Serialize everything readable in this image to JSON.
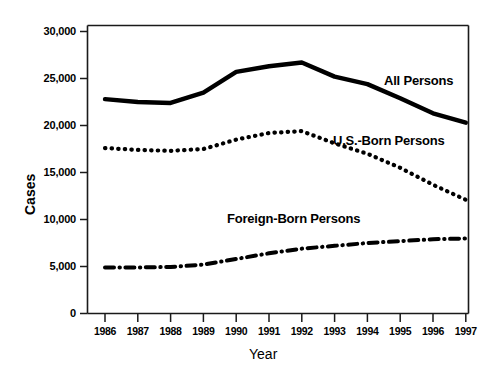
{
  "chart_data": {
    "type": "line",
    "title": "",
    "xlabel": "Year",
    "ylabel": "Cases",
    "x": [
      1986,
      1987,
      1988,
      1989,
      1990,
      1991,
      1992,
      1993,
      1994,
      1995,
      1996,
      1997
    ],
    "categories": [
      "1986",
      "1987",
      "1988",
      "1989",
      "1990",
      "1991",
      "1992",
      "1993",
      "1994",
      "1995",
      "1996",
      "1997"
    ],
    "ylim": [
      0,
      30000
    ],
    "yticks": [
      0,
      5000,
      10000,
      15000,
      20000,
      25000,
      30000
    ],
    "ytick_labels": [
      "0",
      "5,000",
      "10,000",
      "15,000",
      "20,000",
      "25,000",
      "30,000"
    ],
    "grid": false,
    "legend_position": "inline-annotations",
    "series": [
      {
        "name": "All Persons",
        "style": "solid",
        "values": [
          22800,
          22500,
          22400,
          23500,
          25700,
          26300,
          26700,
          25200,
          24400,
          22900,
          21300,
          20300
        ],
        "label_x": 1994.3,
        "label_y": 24400
      },
      {
        "name": "U.S.-Born Persons",
        "style": "dotted",
        "values": [
          17600,
          17400,
          17300,
          17500,
          18500,
          19200,
          19400,
          18100,
          17000,
          15500,
          13700,
          12100
        ],
        "label_x": 1992.7,
        "label_y": 18200
      },
      {
        "name": "Foreign-Born Persons",
        "style": "dash-dot",
        "values": [
          4900,
          4900,
          4950,
          5200,
          5800,
          6400,
          6900,
          7200,
          7500,
          7700,
          7900,
          7980
        ],
        "label_x": 1991.2,
        "label_y": 10300
      }
    ],
    "annotations": [
      {
        "text": "All Persons"
      },
      {
        "text": "U.S.-Born Persons"
      },
      {
        "text": "Foreign-Born Persons"
      }
    ],
    "colors": {
      "line": "#000000",
      "axis": "#1a1a1a",
      "background": "#ffffff",
      "text": "#000000"
    }
  }
}
